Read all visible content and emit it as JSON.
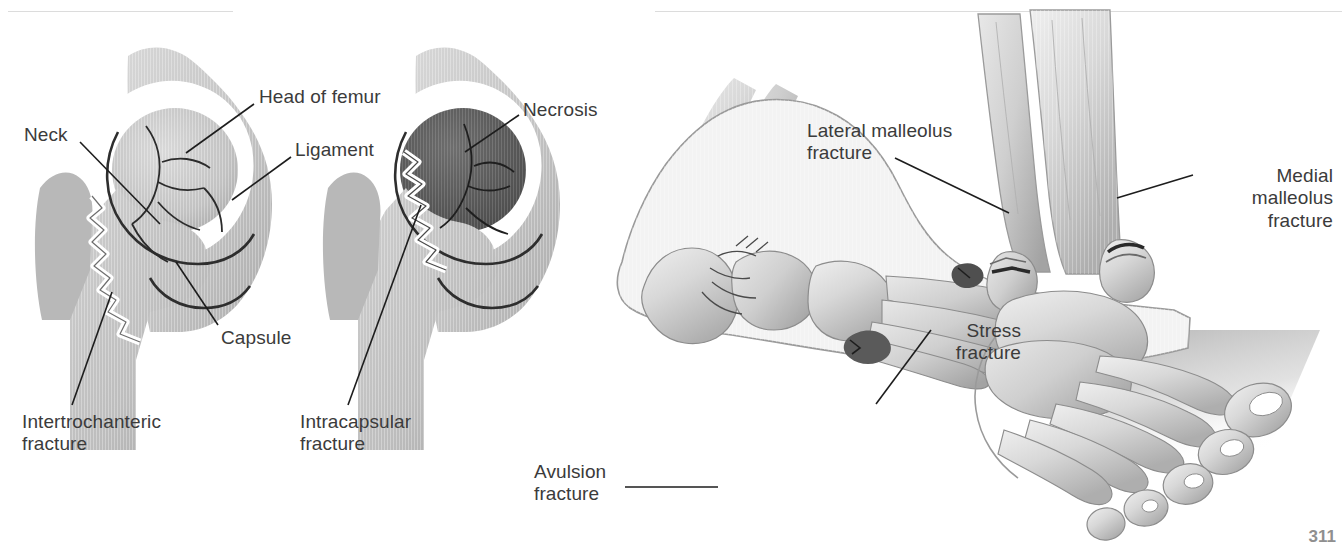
{
  "page": {
    "background_color": "#ffffff",
    "text_color": "#3b3b3b",
    "leader_color": "#1d1d1d",
    "rule_color": "#dcdcdc",
    "page_number": "311"
  },
  "hip_figure": {
    "title": "Hip fractures",
    "panels": [
      {
        "name": "intertrochanteric-hip",
        "description": "Coronal view of hip joint with jagged fracture line through the intertrochanteric region"
      },
      {
        "name": "intracapsular-hip",
        "description": "Coronal view of hip joint with jagged fracture through femoral neck and darkened necrotic femoral head"
      }
    ],
    "labels": [
      {
        "id": "neck",
        "text": "Neck"
      },
      {
        "id": "head-of-femur",
        "text": "Head of femur"
      },
      {
        "id": "ligament",
        "text": "Ligament"
      },
      {
        "id": "capsule",
        "text": "Capsule"
      },
      {
        "id": "intertrochanteric-fracture",
        "text": "Intertrochanteric\nfracture"
      },
      {
        "id": "intracapsular-fracture",
        "text": "Intracapsular\nfracture"
      },
      {
        "id": "necrosis",
        "text": "Necrosis"
      }
    ]
  },
  "foot_figure": {
    "title": "Ankle and foot fractures",
    "panels": [
      {
        "name": "lateral-foot",
        "description": "Lateral view of foot and ankle showing avulsion fracture at base of fifth metatarsal and stress fracture in metatarsal shaft"
      },
      {
        "name": "anterior-ankle",
        "description": "Anteromedial view of ankle and foot showing lateral malleolus (fibula) fracture and medial malleolus (tibia) fracture, with cast shadow"
      }
    ],
    "labels": [
      {
        "id": "lateral-malleolus-fracture",
        "text": "Lateral malleolus\nfracture"
      },
      {
        "id": "medial-malleolus-fracture",
        "text": "Medial\nmalleolus\nfracture"
      },
      {
        "id": "stress-fracture",
        "text": "Stress\nfracture"
      },
      {
        "id": "avulsion-fracture",
        "text": "Avulsion\nfracture"
      }
    ]
  }
}
